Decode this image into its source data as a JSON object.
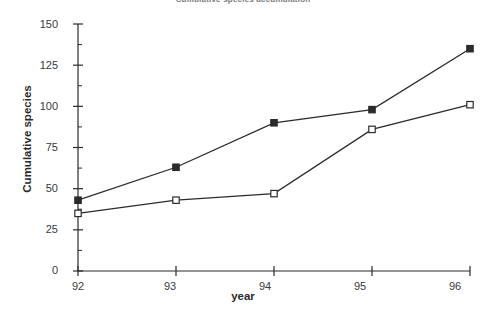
{
  "chart_data": {
    "type": "line",
    "title": "Cumulative species accumulation",
    "xlabel": "year",
    "ylabel": "Cumulative species",
    "x": [
      "92",
      "93",
      "94",
      "95",
      "96"
    ],
    "xlim": [
      92,
      96
    ],
    "ylim": [
      0,
      150
    ],
    "y_ticks": [
      0,
      25,
      50,
      75,
      100,
      125,
      150
    ],
    "y_tick_labels": [
      "0",
      "25",
      "50",
      "75",
      "100",
      "125",
      "150"
    ],
    "y_minor_tick_step": 12.5,
    "x_ticks": [
      92,
      93,
      94,
      95,
      96
    ],
    "x_tick_labels": [
      "92",
      "93",
      "94",
      "95",
      "96"
    ],
    "grid": false,
    "legend": "none",
    "series": [
      {
        "name": "series-filled",
        "marker": "filled-square",
        "color": "#2b2b2b",
        "values": [
          43,
          63,
          90,
          98,
          135
        ]
      },
      {
        "name": "series-open",
        "marker": "open-square",
        "color": "#2b2b2b",
        "values": [
          35,
          43,
          47,
          86,
          101
        ]
      }
    ]
  },
  "axis": {
    "y_label": "Cumulative species",
    "x_label": "year",
    "y_tick_labels": [
      "150",
      "125",
      "100",
      "75",
      "50",
      "25",
      "0"
    ],
    "x_tick_labels": [
      "92",
      "93",
      "94",
      "95",
      "96"
    ]
  },
  "title": "Cumulative species accumulation"
}
